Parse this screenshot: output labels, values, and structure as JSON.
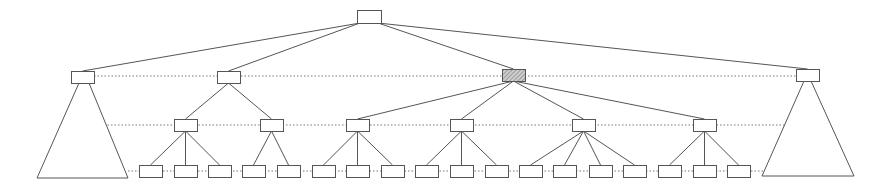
{
  "diagram": {
    "type": "tree",
    "colors": {
      "stroke": "#555555",
      "background": "#ffffff",
      "hatch": "#777777"
    },
    "node_size": {
      "w": 23,
      "h": 12
    },
    "level_lines": [
      {
        "level": 1,
        "y": 76,
        "x1": 94,
        "x2": 796
      },
      {
        "level": 2,
        "y": 125,
        "x1": 104,
        "x2": 788
      },
      {
        "level": 3,
        "y": 171,
        "x1": 128,
        "x2": 764
      }
    ],
    "nodes": [
      {
        "id": "root",
        "level": 0,
        "x": 357,
        "y": 10,
        "w": 24,
        "h": 13,
        "shaded": false
      },
      {
        "id": "l1-a",
        "level": 1,
        "x": 71,
        "y": 71,
        "shaded": false,
        "collapsed": true
      },
      {
        "id": "l1-b",
        "level": 1,
        "x": 217,
        "y": 71,
        "shaded": false
      },
      {
        "id": "l1-c",
        "level": 1,
        "x": 502,
        "y": 69,
        "shaded": true
      },
      {
        "id": "l1-d",
        "level": 1,
        "x": 796,
        "y": 69,
        "shaded": false,
        "collapsed": true
      },
      {
        "id": "l2-1",
        "level": 2,
        "x": 174,
        "y": 119,
        "parent": "l1-b"
      },
      {
        "id": "l2-2",
        "level": 2,
        "x": 260,
        "y": 119,
        "parent": "l1-b"
      },
      {
        "id": "l2-3",
        "level": 2,
        "x": 346,
        "y": 119,
        "parent": "l1-c"
      },
      {
        "id": "l2-4",
        "level": 2,
        "x": 450,
        "y": 119,
        "parent": "l1-c"
      },
      {
        "id": "l2-5",
        "level": 2,
        "x": 572,
        "y": 119,
        "parent": "l1-c"
      },
      {
        "id": "l2-6",
        "level": 2,
        "x": 693,
        "y": 119,
        "parent": "l1-c"
      }
    ],
    "leaves": [
      {
        "x": 139,
        "parent": "l2-1"
      },
      {
        "x": 174,
        "parent": "l2-1"
      },
      {
        "x": 208,
        "parent": "l2-1"
      },
      {
        "x": 242,
        "parent": "l2-2"
      },
      {
        "x": 277,
        "parent": "l2-2"
      },
      {
        "x": 312,
        "parent": "l2-3"
      },
      {
        "x": 346,
        "parent": "l2-3"
      },
      {
        "x": 381,
        "parent": "l2-3"
      },
      {
        "x": 415,
        "parent": "l2-4"
      },
      {
        "x": 450,
        "parent": "l2-4"
      },
      {
        "x": 485,
        "parent": "l2-4"
      },
      {
        "x": 519,
        "parent": "l2-5"
      },
      {
        "x": 553,
        "parent": "l2-5"
      },
      {
        "x": 589,
        "parent": "l2-5"
      },
      {
        "x": 623,
        "parent": "l2-5"
      },
      {
        "x": 658,
        "parent": "l2-6"
      },
      {
        "x": 693,
        "parent": "l2-6"
      },
      {
        "x": 727,
        "parent": "l2-6"
      }
    ],
    "leaf_y": 165,
    "subtrees": [
      {
        "parent": "l1-a",
        "apex_left": [
          79,
          83
        ],
        "apex_right": [
          89,
          83
        ],
        "base_left": [
          37,
          178
        ],
        "base_right": [
          128,
          178
        ]
      },
      {
        "parent": "l1-d",
        "apex_left": [
          804,
          81
        ],
        "apex_right": [
          811,
          81
        ],
        "base_left": [
          762,
          176
        ],
        "base_right": [
          854,
          176
        ]
      }
    ]
  }
}
